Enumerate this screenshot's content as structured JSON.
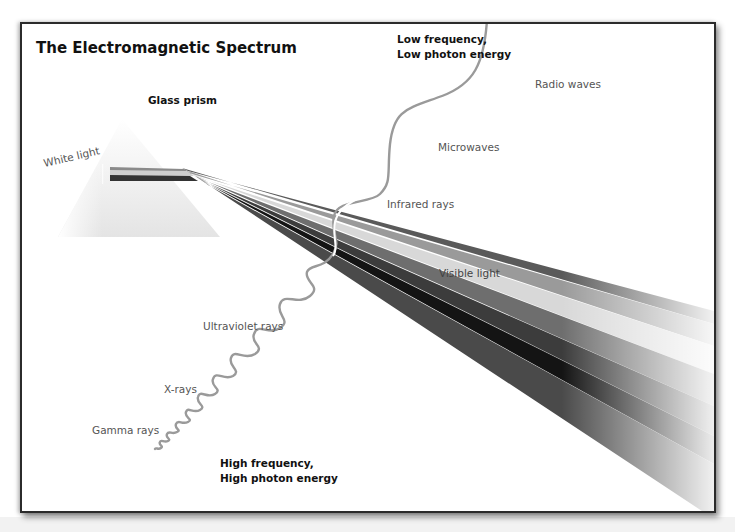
{
  "diagram": {
    "title": "The Electromagnetic Spectrum",
    "prism_label": "Glass prism",
    "input_label": "White light",
    "low_end_label": [
      "Low frequency,",
      "Low photon energy"
    ],
    "high_end_label": [
      "High frequency,",
      "High photon energy"
    ],
    "bands": [
      {
        "name": "Radio waves"
      },
      {
        "name": "Microwaves"
      },
      {
        "name": "Infrared rays"
      },
      {
        "name": "Visible light"
      },
      {
        "name": "Ultraviolet rays"
      },
      {
        "name": "X-rays"
      },
      {
        "name": "Gamma rays"
      }
    ],
    "beam_colors": [
      "#5a5a5a",
      "#9a9a9a",
      "#d8d8d8",
      "#6e6e6e",
      "#3c3c3c",
      "#141414",
      "#4a4a4a"
    ],
    "wave_color": "#9a9a9a",
    "frame_border_color": "#2b2b2b"
  }
}
